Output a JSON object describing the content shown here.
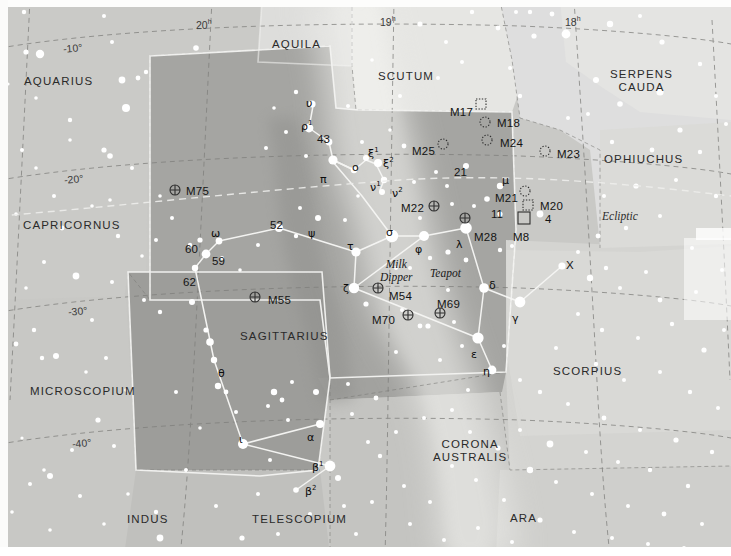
{
  "chart_data": {
    "type": "scatter",
    "xlabel": "Right Ascension (hours)",
    "ylabel": "Declination (degrees)",
    "xlim": [
      20.4,
      17.6
    ],
    "ylim": [
      -45,
      -5
    ],
    "grid": true,
    "projection": "equatorial",
    "ra_ticks": [
      {
        "label": "20",
        "unit": "h",
        "x": 196,
        "y": 18
      },
      {
        "label": "19",
        "unit": "h",
        "x": 380,
        "y": 15
      },
      {
        "label": "18",
        "unit": "h",
        "x": 565,
        "y": 15
      }
    ],
    "dec_ticks": [
      {
        "label": "-10°",
        "x": 63,
        "y": 42
      },
      {
        "label": "-20°",
        "x": 64,
        "y": 173
      },
      {
        "label": "-30°",
        "x": 68,
        "y": 305
      },
      {
        "label": "-40°",
        "x": 72,
        "y": 437
      }
    ],
    "constellations": [
      {
        "name": "AQUARIUS",
        "x": 24,
        "y": 75,
        "lines": [
          "AQUARIUS"
        ]
      },
      {
        "name": "AQUILA",
        "x": 272,
        "y": 38,
        "lines": [
          "AQUILA"
        ]
      },
      {
        "name": "SCUTUM",
        "x": 378,
        "y": 70,
        "lines": [
          "SCUTUM"
        ]
      },
      {
        "name": "SERPENS CAUDA",
        "x": 610,
        "y": 68,
        "lines": [
          "SERPENS",
          "CAUDA"
        ]
      },
      {
        "name": "OPHIUCHUS",
        "x": 604,
        "y": 153,
        "lines": [
          "OPHIUCHUS"
        ]
      },
      {
        "name": "CAPRICORNUS",
        "x": 23,
        "y": 219,
        "lines": [
          "CAPRICORNUS"
        ]
      },
      {
        "name": "SAGITTARIUS",
        "x": 240,
        "y": 330,
        "lines": [
          "SAGITTARIUS"
        ]
      },
      {
        "name": "SCORPIUS",
        "x": 553,
        "y": 365,
        "lines": [
          "SCORPIUS"
        ]
      },
      {
        "name": "MICROSCOPIUM",
        "x": 30,
        "y": 385,
        "lines": [
          "MICROSCOPIUM"
        ]
      },
      {
        "name": "CORONA AUSTRALIS",
        "x": 433,
        "y": 438,
        "lines": [
          "CORONA",
          "AUSTRALIS"
        ]
      },
      {
        "name": "INDUS",
        "x": 127,
        "y": 513,
        "lines": [
          "INDUS"
        ]
      },
      {
        "name": "TELESCOPIUM",
        "x": 252,
        "y": 513,
        "lines": [
          "TELESCOPIUM"
        ]
      },
      {
        "name": "ARA",
        "x": 510,
        "y": 512,
        "lines": [
          "ARA"
        ]
      }
    ],
    "deep_sky_objects": [
      {
        "id": "M75",
        "label": "M75",
        "marker": "globular",
        "mx": 175,
        "my": 190,
        "lx": 186,
        "ly": 185
      },
      {
        "id": "M17",
        "label": "M17",
        "marker": "nebula",
        "mx": 481,
        "my": 104,
        "lx": 450,
        "ly": 106
      },
      {
        "id": "M18",
        "label": "M18",
        "marker": "opencluster",
        "mx": 485,
        "my": 122,
        "lx": 497,
        "ly": 117
      },
      {
        "id": "M24",
        "label": "M24",
        "marker": "opencluster",
        "mx": 487,
        "my": 140,
        "lx": 500,
        "ly": 137
      },
      {
        "id": "M25",
        "label": "M25",
        "marker": "opencluster",
        "mx": 443,
        "my": 144,
        "lx": 412,
        "ly": 145
      },
      {
        "id": "M23",
        "label": "M23",
        "marker": "opencluster",
        "mx": 545,
        "my": 151,
        "lx": 557,
        "ly": 148
      },
      {
        "id": "M22",
        "label": "M22",
        "marker": "globular",
        "mx": 434,
        "my": 206,
        "lx": 401,
        "ly": 202
      },
      {
        "id": "M21",
        "label": "M21",
        "marker": "opencluster",
        "mx": 525,
        "my": 191,
        "lx": 495,
        "ly": 192
      },
      {
        "id": "M20",
        "label": "M20",
        "marker": "nebula",
        "mx": 528,
        "my": 205,
        "lx": 540,
        "ly": 200
      },
      {
        "id": "M8",
        "label": "M8",
        "marker": "nebula",
        "mx": 524,
        "my": 218,
        "lx": 513,
        "ly": 231
      },
      {
        "id": "M28",
        "label": "M28",
        "marker": "globular",
        "mx": 465,
        "my": 218,
        "lx": 474,
        "ly": 231
      },
      {
        "id": "M55",
        "label": "M55",
        "marker": "globular",
        "mx": 255,
        "my": 297,
        "lx": 268,
        "ly": 294
      },
      {
        "id": "M54",
        "label": "M54",
        "marker": "globular",
        "mx": 378,
        "my": 288,
        "lx": 389,
        "ly": 290
      },
      {
        "id": "M70",
        "label": "M70",
        "marker": "globular",
        "mx": 408,
        "my": 315,
        "lx": 372,
        "ly": 314
      },
      {
        "id": "M69",
        "label": "M69",
        "marker": "globular",
        "mx": 440,
        "my": 313,
        "lx": 437,
        "ly": 298
      }
    ],
    "star_labels": [
      {
        "label": "υ",
        "type": "greek",
        "x": 306,
        "y": 97
      },
      {
        "label": "ρ",
        "sup": "1",
        "type": "greek",
        "x": 301,
        "y": 119
      },
      {
        "label": "43",
        "type": "number",
        "x": 317,
        "y": 133
      },
      {
        "label": "π",
        "type": "greek",
        "x": 320,
        "y": 173
      },
      {
        "label": "o",
        "type": "greek",
        "x": 352,
        "y": 161
      },
      {
        "label": "ξ",
        "sup": "1",
        "type": "greek",
        "x": 368,
        "y": 146
      },
      {
        "label": "ξ",
        "sup": "2",
        "type": "greek",
        "x": 383,
        "y": 156
      },
      {
        "label": "ν",
        "sup": "1",
        "type": "greek",
        "x": 370,
        "y": 180
      },
      {
        "label": "ν",
        "sup": "2",
        "type": "greek",
        "x": 392,
        "y": 186
      },
      {
        "label": "21",
        "type": "number",
        "x": 454,
        "y": 166
      },
      {
        "label": "μ",
        "type": "greek",
        "x": 502,
        "y": 174
      },
      {
        "label": "11",
        "type": "number",
        "x": 491,
        "y": 208
      },
      {
        "label": "4",
        "type": "number",
        "x": 545,
        "y": 213
      },
      {
        "label": "52",
        "type": "number",
        "x": 270,
        "y": 219
      },
      {
        "label": "ψ",
        "type": "greek",
        "x": 308,
        "y": 227
      },
      {
        "label": "ω",
        "type": "greek",
        "x": 211,
        "y": 227
      },
      {
        "label": "60",
        "type": "number",
        "x": 185,
        "y": 243
      },
      {
        "label": "59",
        "type": "number",
        "x": 212,
        "y": 255
      },
      {
        "label": "62",
        "type": "number",
        "x": 183,
        "y": 276
      },
      {
        "label": "τ",
        "type": "greek",
        "x": 347,
        "y": 240
      },
      {
        "label": "σ",
        "type": "greek",
        "x": 386,
        "y": 226
      },
      {
        "label": "φ",
        "type": "greek",
        "x": 415,
        "y": 243
      },
      {
        "label": "λ",
        "type": "greek",
        "x": 456,
        "y": 238
      },
      {
        "label": "ζ",
        "type": "greek",
        "x": 343,
        "y": 282
      },
      {
        "label": "δ",
        "type": "greek",
        "x": 489,
        "y": 279
      },
      {
        "label": "γ",
        "type": "greek",
        "x": 512,
        "y": 312
      },
      {
        "label": "X",
        "type": "number",
        "x": 566,
        "y": 259
      },
      {
        "label": "ε",
        "type": "greek",
        "x": 471,
        "y": 348
      },
      {
        "label": "η",
        "type": "greek",
        "x": 483,
        "y": 365
      },
      {
        "label": "θ",
        "type": "greek",
        "x": 218,
        "y": 367
      },
      {
        "label": "ι",
        "type": "greek",
        "x": 239,
        "y": 433
      },
      {
        "label": "α",
        "type": "greek",
        "x": 307,
        "y": 431
      },
      {
        "label": "β",
        "sup": "1",
        "type": "greek",
        "x": 312,
        "y": 460
      },
      {
        "label": "β",
        "sup": "2",
        "type": "greek",
        "x": 305,
        "y": 484
      }
    ],
    "asterisms": [
      {
        "name": "Milk Dipper",
        "lines": [
          "Milk",
          "Dipper"
        ],
        "x": 380,
        "y": 258
      },
      {
        "name": "Teapot",
        "lines": [
          "Teapot"
        ],
        "x": 430,
        "y": 267
      }
    ],
    "annotations": [
      {
        "name": "Ecliptic",
        "label": "Ecliptic",
        "x": 602,
        "y": 210
      }
    ],
    "colors": {
      "background": "#c9c9c6",
      "milky_way": "#a9a9a6",
      "dark_region": "#9a9a97",
      "light_region": "#dcdcd9",
      "lightest_region": "#e9e9e6",
      "star": "#ffffff",
      "grid": "#8a8a87",
      "constellation_line": "#f2f2f0",
      "text": "#1d1d1d"
    },
    "legend": {
      "position": "none",
      "entries": []
    }
  }
}
